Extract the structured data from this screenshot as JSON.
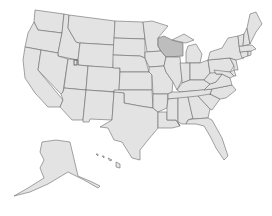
{
  "map": {
    "title": "United States",
    "highlighted_state": "Wisconsin",
    "colors": {
      "background": "#ffffff",
      "state_fill": "#e3e3e3",
      "highlight_fill": "#bdbdbd",
      "border": "#6a6a6a"
    },
    "states": [
      {
        "id": "WA",
        "name": "Washington",
        "highlighted": false,
        "d": "M35,10 L64,14 L62,33 L38,30 L34,22 Z"
      },
      {
        "id": "OR",
        "name": "Oregon",
        "highlighted": false,
        "d": "M34,22 L38,30 L62,33 L58,53 L25,47 L28,33 Z"
      },
      {
        "id": "CA",
        "name": "California",
        "highlighted": false,
        "d": "M25,47 L41,50 L38,70 L63,100 L60,107 L48,107 L35,93 L25,78 L23,60 Z"
      },
      {
        "id": "ID",
        "name": "Idaho",
        "highlighted": false,
        "d": "M64,14 L69,15 L68,28 L76,42 L80,43 L78,60 L58,56 L58,53 L62,33 Z"
      },
      {
        "id": "NV",
        "name": "Nevada",
        "highlighted": false,
        "d": "M41,50 L58,53 L58,56 L68,59 L63,92 L61,94 L38,70 Z"
      },
      {
        "id": "MT",
        "name": "Montana",
        "highlighted": false,
        "d": "M69,15 L115,21 L114,45 L80,43 L76,42 L68,28 Z"
      },
      {
        "id": "WY",
        "name": "Wyoming",
        "highlighted": false,
        "d": "M80,43 L114,45 L113,68 L78,65 L78,60 Z"
      },
      {
        "id": "UT",
        "name": "Utah",
        "highlighted": false,
        "d": "M68,59 L78,60 L78,65 L88,66 L86,90 L64,88 Z"
      },
      {
        "id": "AZ",
        "name": "Arizona",
        "highlighted": false,
        "d": "M64,88 L86,90 L83,120 L72,120 L60,107 L63,100 L61,94 L63,92 Z"
      },
      {
        "id": "CO",
        "name": "Colorado",
        "highlighted": false,
        "d": "M88,66 L120,68 L119,92 L86,90 Z"
      },
      {
        "id": "NM",
        "name": "New Mexico",
        "highlighted": false,
        "d": "M86,90 L114,92 L112,120 L90,119 L89,122 L83,122 L83,120 Z"
      },
      {
        "id": "ND",
        "name": "North Dakota",
        "highlighted": false,
        "d": "M115,21 L143,22 L145,39 L114,38 Z"
      },
      {
        "id": "SD",
        "name": "South Dakota",
        "highlighted": false,
        "d": "M114,38 L145,39 L145,58 L140,56 L113,55 Z"
      },
      {
        "id": "NE",
        "name": "Nebraska",
        "highlighted": false,
        "d": "M113,55 L140,56 L145,58 L149,72 L120,72 L120,68 L113,68 Z"
      },
      {
        "id": "KS",
        "name": "Kansas",
        "highlighted": false,
        "d": "M120,72 L149,72 L152,75 L152,90 L119,90 Z"
      },
      {
        "id": "OK",
        "name": "Oklahoma",
        "highlighted": false,
        "d": "M114,90 L152,90 L153,108 L140,106 L124,103 L124,93 L114,93 Z"
      },
      {
        "id": "TX",
        "name": "Texas",
        "highlighted": false,
        "d": "M124,93 L124,103 L140,106 L153,108 L158,112 L158,128 L148,140 L140,150 L140,160 L132,158 L122,142 L114,140 L108,128 L100,127 L112,120 L114,92 Z"
      },
      {
        "id": "MN",
        "name": "Minnesota",
        "highlighted": false,
        "d": "M143,22 L152,21 L168,26 L158,38 L158,46 L161,51 L147,52 L145,39 Z"
      },
      {
        "id": "IA",
        "name": "Iowa",
        "highlighted": false,
        "d": "M145,52 L161,51 L166,57 L164,66 L149,67 L145,58 Z"
      },
      {
        "id": "MO",
        "name": "Missouri",
        "highlighted": false,
        "d": "M149,67 L164,66 L166,72 L173,82 L172,92 L168,94 L153,94 L152,75 L149,72 Z"
      },
      {
        "id": "AR",
        "name": "Arkansas",
        "highlighted": false,
        "d": "M153,94 L168,94 L167,108 L158,112 L153,108 Z"
      },
      {
        "id": "LA",
        "name": "Louisiana",
        "highlighted": false,
        "d": "M158,112 L167,112 L167,120 L176,120 L180,126 L172,128 L160,128 L158,128 Z"
      },
      {
        "id": "WI",
        "name": "Wisconsin",
        "highlighted": true,
        "d": "M158,38 L164,36 L172,40 L183,43 L183,56 L166,57 L161,51 L158,46 Z"
      },
      {
        "id": "IL",
        "name": "Illinois",
        "highlighted": false,
        "d": "M166,57 L180,57 L182,80 L177,90 L173,82 L166,72 L164,66 Z"
      },
      {
        "id": "MI",
        "name": "Michigan",
        "highlighted": false,
        "d": "M172,40 L184,34 L194,40 L186,43 Z M188,46 L196,44 L202,54 L200,63 L186,63 L186,52 Z"
      },
      {
        "id": "IN",
        "name": "Indiana",
        "highlighted": false,
        "d": "M180,63 L190,63 L190,80 L182,83 L182,80 Z"
      },
      {
        "id": "OH",
        "name": "Ohio",
        "highlighted": false,
        "d": "M190,63 L200,63 L208,60 L210,73 L204,80 L195,80 L190,80 Z"
      },
      {
        "id": "KY",
        "name": "Kentucky",
        "highlighted": false,
        "d": "M177,90 L182,83 L190,80 L204,80 L210,84 L204,90 L180,92 Z"
      },
      {
        "id": "TN",
        "name": "Tennessee",
        "highlighted": false,
        "d": "M172,92 L180,92 L212,89 L210,95 L195,98 L168,99 L168,94 Z"
      },
      {
        "id": "MS",
        "name": "Mississippi",
        "highlighted": false,
        "d": "M168,99 L178,98 L178,122 L180,126 L176,120 L167,120 L167,112 L167,108 Z"
      },
      {
        "id": "AL",
        "name": "Alabama",
        "highlighted": false,
        "d": "M178,98 L188,97 L193,118 L188,120 L186,124 L182,124 L178,122 Z"
      },
      {
        "id": "GA",
        "name": "Georgia",
        "highlighted": false,
        "d": "M188,97 L198,96 L210,109 L208,118 L193,119 Z"
      },
      {
        "id": "FL",
        "name": "Florida",
        "highlighted": false,
        "d": "M186,124 L188,120 L193,119 L208,118 L212,120 L222,138 L228,156 L224,160 L216,148 L210,136 L204,126 L196,124 Z"
      },
      {
        "id": "SC",
        "name": "South Carolina",
        "highlighted": false,
        "d": "M198,96 L210,94 L220,99 L212,110 L210,109 Z"
      },
      {
        "id": "NC",
        "name": "North Carolina",
        "highlighted": false,
        "d": "M210,95 L212,89 L232,85 L236,90 L226,98 L220,99 L210,94 Z"
      },
      {
        "id": "VA",
        "name": "Virginia",
        "highlighted": false,
        "d": "M204,90 L210,84 L216,82 L222,74 L230,78 L232,85 L212,89 Z"
      },
      {
        "id": "WV",
        "name": "West Virginia",
        "highlighted": false,
        "d": "M204,80 L210,73 L214,70 L216,74 L222,74 L216,82 L210,84 Z"
      },
      {
        "id": "PA",
        "name": "Pennsylvania",
        "highlighted": false,
        "d": "M208,60 L230,58 L234,66 L230,72 L210,73 Z"
      },
      {
        "id": "MD",
        "name": "Maryland",
        "highlighted": false,
        "d": "M214,70 L230,72 L234,76 L230,78 L222,74 L216,74 Z"
      },
      {
        "id": "DE",
        "name": "Delaware",
        "highlighted": false,
        "d": "M230,72 L234,70 L236,76 L234,76 Z"
      },
      {
        "id": "NJ",
        "name": "New Jersey",
        "highlighted": false,
        "d": "M230,58 L236,60 L238,70 L234,70 L234,66 Z"
      },
      {
        "id": "NY",
        "name": "New York",
        "highlighted": false,
        "d": "M208,60 L210,52 L222,48 L228,38 L238,36 L240,52 L244,58 L236,60 L230,58 Z"
      },
      {
        "id": "CT",
        "name": "Connecticut",
        "highlighted": false,
        "d": "M240,52 L248,51 L248,56 L242,58 Z"
      },
      {
        "id": "RI",
        "name": "Rhode Island",
        "highlighted": false,
        "d": "M248,51 L251,51 L251,55 L248,56 Z"
      },
      {
        "id": "MA",
        "name": "Massachusetts",
        "highlighted": false,
        "d": "M239,46 L252,45 L256,49 L251,51 L240,52 Z"
      },
      {
        "id": "VT",
        "name": "Vermont",
        "highlighted": false,
        "d": "M238,36 L244,34 L243,46 L239,46 Z"
      },
      {
        "id": "NH",
        "name": "New Hampshire",
        "highlighted": false,
        "d": "M244,34 L247,28 L250,44 L243,46 Z"
      },
      {
        "id": "ME",
        "name": "Maine",
        "highlighted": false,
        "d": "M247,28 L250,14 L256,12 L262,24 L256,32 L250,44 Z"
      },
      {
        "id": "AK",
        "name": "Alaska",
        "highlighted": false,
        "d": "M42,142 L56,140 L70,142 L78,176 L92,182 L100,186 L98,188 L84,180 L68,172 L58,178 L48,184 L30,192 L14,196 L28,188 L44,178 L40,168 L44,160 L40,152 Z"
      },
      {
        "id": "HI",
        "name": "Hawaii",
        "highlighted": false,
        "d": "M96,154 L98,154 L98,156 Z M102,156 L104,156 L104,158 Z M108,158 L112,160 L110,161 Z M116,162 L120,164 L120,168 L116,167 Z"
      }
    ]
  }
}
